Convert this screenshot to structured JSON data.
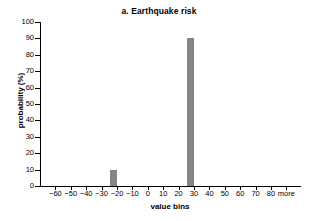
{
  "chart_data": {
    "type": "bar",
    "title": "a. Earthquake risk",
    "xlabel": "value bins",
    "ylabel": "probability (%)",
    "categories": [
      "-60",
      "-50",
      "-40",
      "-30",
      "-20",
      "-10",
      "0",
      "10",
      "20",
      "30",
      "40",
      "50",
      "60",
      "70",
      "80",
      "more"
    ],
    "values": [
      0,
      0,
      0,
      0,
      10,
      0,
      0,
      0,
      0,
      90,
      0,
      0,
      0,
      0,
      0,
      0
    ],
    "ylim": [
      0,
      100
    ],
    "ytick_labels": [
      "100",
      "90",
      "80",
      "70",
      "60",
      "50",
      "40",
      "30",
      "20",
      "10",
      "0"
    ],
    "ytick_values": [
      100,
      90,
      80,
      70,
      60,
      50,
      40,
      30,
      20,
      10,
      0
    ],
    "grid": false,
    "legend": "none",
    "bar_color": "#848484",
    "axis_color": "#000000",
    "background": "#ffffff"
  }
}
